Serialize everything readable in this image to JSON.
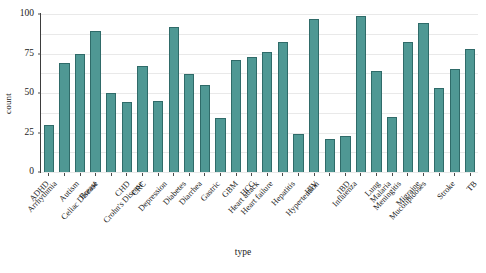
{
  "chart_data": {
    "type": "bar",
    "title": "",
    "xlabel": "type",
    "ylabel": "count",
    "ylim": [
      0,
      100
    ],
    "yticks": [
      0,
      25,
      50,
      75,
      100
    ],
    "grid": true,
    "gridlines_minor_step": 12.5,
    "legend": "none",
    "bar_color": "#4f9894",
    "bar_edge_color": "#2f6b69",
    "categories": [
      "ADHD",
      "Arrhythmia",
      "Autism",
      "Breast",
      "Celiac Disease",
      "CHD",
      "CRC",
      "Crohn's Disease",
      "Depression",
      "Diabetes",
      "Diarrhea",
      "Gastric",
      "GBM",
      "HCC",
      "Heart attack",
      "Heart failure",
      "Hepatitis",
      "HIV",
      "Hypertention",
      "IBD",
      "Influenza",
      "Lung",
      "Malaria",
      "Meningitis",
      "Migraine",
      "Mucolipidoses",
      "Stroke",
      "TB"
    ],
    "values": [
      30,
      69,
      75,
      89,
      50,
      44,
      67,
      45,
      92,
      62,
      55,
      34,
      71,
      73,
      76,
      82,
      24,
      97,
      21,
      23,
      99,
      64,
      35,
      82,
      94,
      53,
      65,
      78
    ]
  }
}
